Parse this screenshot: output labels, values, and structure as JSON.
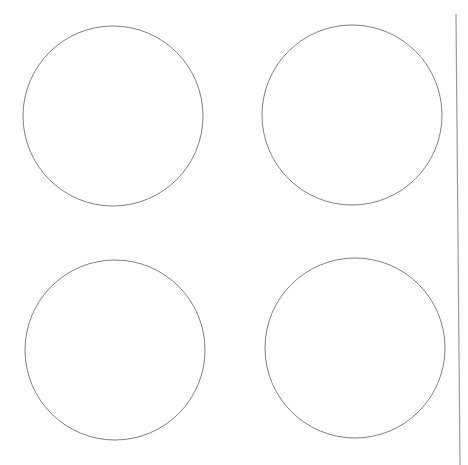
{
  "canvas": {
    "width": 468,
    "height": 465,
    "background": "#ffffff"
  },
  "shapes": {
    "circles": [
      {
        "id": "circle-top-left",
        "cx": 113,
        "cy": 116,
        "r": 90,
        "stroke": "#808080",
        "fill": "none"
      },
      {
        "id": "circle-top-right",
        "cx": 352,
        "cy": 115,
        "r": 90,
        "stroke": "#808080",
        "fill": "none"
      },
      {
        "id": "circle-bottom-left",
        "cx": 115,
        "cy": 350,
        "r": 90,
        "stroke": "#808080",
        "fill": "none"
      },
      {
        "id": "circle-bottom-right",
        "cx": 355,
        "cy": 348,
        "r": 90,
        "stroke": "#808080",
        "fill": "none"
      }
    ],
    "divider": {
      "x1": 456,
      "y1": 14,
      "x2": 460,
      "y2": 465,
      "stroke": "#9a9a9a"
    }
  }
}
